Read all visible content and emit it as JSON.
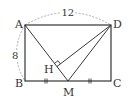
{
  "figure": {
    "type": "geometry-diagram",
    "colors": {
      "line": "#222222",
      "dashed": "#999999",
      "text": "#333333"
    },
    "points": {
      "A": {
        "label": "A",
        "x": 25,
        "y": 25
      },
      "B": {
        "label": "B",
        "x": 25,
        "y": 81
      },
      "C": {
        "label": "C",
        "x": 111,
        "y": 81
      },
      "D": {
        "label": "D",
        "x": 111,
        "y": 25
      },
      "M": {
        "label": "M",
        "x": 68,
        "y": 81
      },
      "H": {
        "label": "H",
        "x": 57,
        "y": 66
      }
    },
    "measurements": {
      "AD": "12",
      "AB": "8"
    },
    "marks": {
      "BM_CM_equal": "||",
      "right_angle_at": "H"
    }
  }
}
